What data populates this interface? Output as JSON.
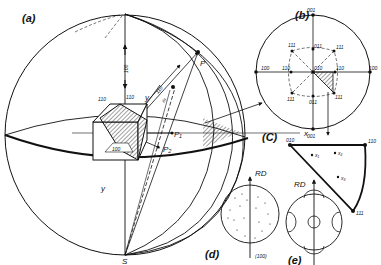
{
  "panels": {
    "a": {
      "label": "(a)",
      "poles": {
        "P": "P",
        "S": "S",
        "P1": "P₁",
        "P2": "P₂"
      },
      "axes": {
        "x": "x",
        "y": "y",
        "y_bottom": "y"
      },
      "cube_faces": {
        "top_left": "110",
        "top_right": "110",
        "front": "100"
      },
      "line_labels": {
        "vertical": "100",
        "diag1": "110",
        "diag2": "m"
      }
    },
    "b": {
      "label": "(b)",
      "poles": {
        "top": "001",
        "bottom": "001",
        "left": "100",
        "right": "100",
        "center": "010",
        "inner_top": "011",
        "inner_bottom": "011",
        "inner_left": "110",
        "inner_right": "110",
        "ul": "111",
        "ur": "111",
        "ll": "111",
        "lr": "111"
      }
    },
    "c": {
      "label": "(C)",
      "corners": {
        "c010": "010",
        "c110": "110",
        "c111": "111"
      },
      "points": [
        "x₁",
        "x₂",
        "x₃"
      ]
    },
    "d": {
      "label": "(d)",
      "rd": "RD",
      "plane": "(100)"
    },
    "e": {
      "label": "(e)",
      "rd": "RD"
    }
  },
  "colors": {
    "ink": "#111111",
    "background": "#ffffff"
  }
}
